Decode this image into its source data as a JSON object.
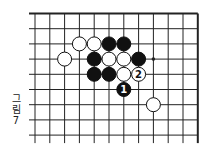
{
  "diagram": {
    "caption_lines": [
      "그",
      "림",
      "7"
    ],
    "board": {
      "columns": 12,
      "rows": 9,
      "edges": [
        "top",
        "right"
      ],
      "colors": {
        "line": "#222222",
        "black": "#111111",
        "white": "#ffffff",
        "label_on_black": "#ffffff",
        "label_on_white": "#111111"
      }
    },
    "stones": [
      {
        "color": "white",
        "col": 3,
        "row": 2,
        "label": ""
      },
      {
        "color": "white",
        "col": 4,
        "row": 2,
        "label": ""
      },
      {
        "color": "black",
        "col": 5,
        "row": 2,
        "label": ""
      },
      {
        "color": "black",
        "col": 6,
        "row": 2,
        "label": ""
      },
      {
        "color": "white",
        "col": 2,
        "row": 3,
        "label": ""
      },
      {
        "color": "black",
        "col": 4,
        "row": 3,
        "label": ""
      },
      {
        "color": "white",
        "col": 5,
        "row": 3,
        "label": ""
      },
      {
        "color": "white",
        "col": 6,
        "row": 3,
        "label": ""
      },
      {
        "color": "black",
        "col": 7,
        "row": 3,
        "label": ""
      },
      {
        "color": "black",
        "col": 4,
        "row": 4,
        "label": ""
      },
      {
        "color": "black",
        "col": 5,
        "row": 4,
        "label": ""
      },
      {
        "color": "white",
        "col": 6,
        "row": 4,
        "label": ""
      },
      {
        "color": "white",
        "col": 7,
        "row": 4,
        "label": "2"
      },
      {
        "color": "black",
        "col": 6,
        "row": 5,
        "label": "1"
      },
      {
        "color": "white",
        "col": 8,
        "row": 6,
        "label": ""
      }
    ],
    "markers": [
      {
        "type": "dot",
        "col": 8,
        "row": 3
      }
    ]
  }
}
